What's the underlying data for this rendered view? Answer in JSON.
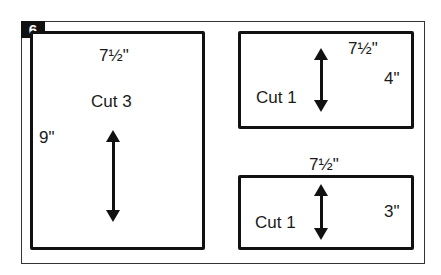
{
  "step_number": "6",
  "pieces": [
    {
      "width_label": "7½\"",
      "height_label": "9\"",
      "cut_label": "Cut 3",
      "grain_arrow": "double-arrow-vertical"
    },
    {
      "width_label": "7½\"",
      "height_label": "4\"",
      "cut_label": "Cut 1",
      "grain_arrow": "double-arrow-vertical"
    },
    {
      "width_label": "7½\"",
      "height_label": "3\"",
      "cut_label": "Cut 1",
      "grain_arrow": "double-arrow-vertical"
    }
  ]
}
